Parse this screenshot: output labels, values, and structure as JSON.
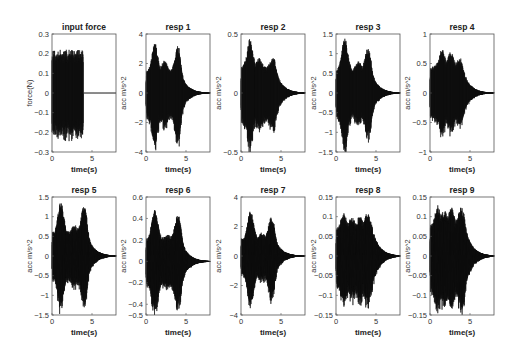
{
  "figure": {
    "layout": {
      "rows": 2,
      "cols": 5
    }
  },
  "chart_data": [
    {
      "type": "line",
      "title": "input force",
      "xlabel": "time(s)",
      "ylabel": "force(N)",
      "xlim": [
        0,
        8
      ],
      "ylim": [
        -0.3,
        0.3
      ],
      "xticks": [
        "0",
        "5"
      ],
      "yticks": [
        "0.3",
        "0.2",
        "0.1",
        "0",
        "-0.1",
        "-0.2",
        "-0.3"
      ],
      "ytick_values": [
        0.3,
        0.2,
        0.1,
        0,
        -0.1,
        -0.2,
        -0.3
      ],
      "signal": {
        "kind": "forcing",
        "amplitude": 0.2,
        "peak": 0.22,
        "end_time": 3.9
      },
      "grid": false
    },
    {
      "type": "line",
      "title": "resp 1",
      "xlabel": "time(s)",
      "ylabel": "acc m/s^2",
      "xlim": [
        0,
        8
      ],
      "ylim": [
        -4,
        4
      ],
      "xticks": [
        "0",
        "5"
      ],
      "yticks": [
        "4",
        "2",
        "0",
        "-2",
        "-4"
      ],
      "ytick_values": [
        4,
        2,
        0,
        -2,
        -4
      ],
      "signal": {
        "kind": "response",
        "peaks": [
          [
            1.1,
            3.4
          ],
          [
            2.3,
            2.2
          ],
          [
            4.0,
            3.2
          ]
        ],
        "base": 1.5,
        "decay_start": 4.2,
        "decay_end": 8.0,
        "min": -3.6
      },
      "grid": false
    },
    {
      "type": "line",
      "title": "resp 2",
      "xlabel": "time(s)",
      "ylabel": "acc m/s^2",
      "xlim": [
        0,
        8
      ],
      "ylim": [
        -0.5,
        0.5
      ],
      "xticks": [
        "0",
        "5"
      ],
      "yticks": [
        "0.5",
        "0",
        "-0.5"
      ],
      "ytick_values": [
        0.5,
        0,
        -0.5
      ],
      "signal": {
        "kind": "response",
        "peaks": [
          [
            1.1,
            0.46
          ],
          [
            2.3,
            0.3
          ],
          [
            4.0,
            0.3
          ]
        ],
        "base": 0.22,
        "decay_start": 4.2,
        "decay_end": 8.0,
        "min": -0.48
      },
      "grid": false
    },
    {
      "type": "line",
      "title": "resp 3",
      "xlabel": "time(s)",
      "ylabel": "acc m/s^2",
      "xlim": [
        0,
        8
      ],
      "ylim": [
        -1.5,
        1.5
      ],
      "xticks": [
        "0",
        "5"
      ],
      "yticks": [
        "1.5",
        "1",
        "0.5",
        "0",
        "-0.5",
        "-1",
        "-1.5"
      ],
      "ytick_values": [
        1.5,
        1,
        0.5,
        0,
        -0.5,
        -1,
        -1.5
      ],
      "signal": {
        "kind": "response",
        "peaks": [
          [
            1.1,
            1.4
          ],
          [
            2.8,
            0.8
          ],
          [
            4.0,
            1.15
          ]
        ],
        "base": 0.6,
        "decay_start": 4.3,
        "decay_end": 8.0,
        "min": -1.4
      },
      "grid": false
    },
    {
      "type": "line",
      "title": "resp 4",
      "xlabel": "time(s)",
      "ylabel": "acc m/s^2",
      "xlim": [
        0,
        8
      ],
      "ylim": [
        -1,
        1
      ],
      "xticks": [
        "0",
        "5"
      ],
      "yticks": [
        "1",
        "0.5",
        "0",
        "-0.5",
        "-1"
      ],
      "ytick_values": [
        1,
        0.5,
        0,
        -0.5,
        -1
      ],
      "signal": {
        "kind": "response",
        "peaks": [
          [
            1.5,
            0.75
          ],
          [
            2.6,
            0.7
          ],
          [
            3.7,
            0.6
          ]
        ],
        "base": 0.45,
        "decay_start": 4.0,
        "decay_end": 8.0,
        "min": -0.72
      },
      "grid": false
    },
    {
      "type": "line",
      "title": "resp 5",
      "xlabel": "time(s)",
      "ylabel": "acc m/s^2",
      "xlim": [
        0,
        8
      ],
      "ylim": [
        -1.5,
        1.5
      ],
      "xticks": [
        "0",
        "5"
      ],
      "yticks": [
        "1.5",
        "1",
        "0.5",
        "0",
        "-0.5",
        "-1",
        "-1.5"
      ],
      "ytick_values": [
        1.5,
        1,
        0.5,
        0,
        -0.5,
        -1,
        -1.5
      ],
      "signal": {
        "kind": "response",
        "peaks": [
          [
            1.1,
            1.4
          ],
          [
            2.8,
            0.8
          ],
          [
            4.0,
            1.3
          ]
        ],
        "base": 0.6,
        "decay_start": 4.3,
        "decay_end": 8.0,
        "min": -1.4
      },
      "grid": false
    },
    {
      "type": "line",
      "title": "resp 6",
      "xlabel": "time(s)",
      "ylabel": "acc m/s^2",
      "xlim": [
        0,
        8
      ],
      "ylim": [
        -0.5,
        0.6
      ],
      "xticks": [
        "0",
        "5"
      ],
      "yticks": [
        "0.6",
        "0.4",
        "0.2",
        "0",
        "-0.2",
        "-0.4",
        "-0.5"
      ],
      "ytick_values": [
        0.6,
        0.4,
        0.2,
        0,
        -0.2,
        -0.4,
        -0.5
      ],
      "signal": {
        "kind": "response",
        "peaks": [
          [
            1.1,
            0.48
          ],
          [
            2.8,
            0.25
          ],
          [
            4.0,
            0.45
          ]
        ],
        "base": 0.22,
        "decay_start": 4.3,
        "decay_end": 8.0,
        "min": -0.48
      },
      "grid": false
    },
    {
      "type": "line",
      "title": "resp 7",
      "xlabel": "time(s)",
      "ylabel": "acc m/s^2",
      "xlim": [
        0,
        8
      ],
      "ylim": [
        -4,
        4
      ],
      "xticks": [
        "0",
        "5"
      ],
      "yticks": [
        "4",
        "2",
        "0",
        "-2",
        "-4"
      ],
      "ytick_values": [
        4,
        2,
        0,
        -2,
        -4
      ],
      "signal": {
        "kind": "response",
        "peaks": [
          [
            1.2,
            3.1
          ],
          [
            2.6,
            1.6
          ],
          [
            3.8,
            2.7
          ]
        ],
        "base": 1.2,
        "decay_start": 4.2,
        "decay_end": 8.0,
        "min": -3.4
      },
      "grid": false
    },
    {
      "type": "line",
      "title": "resp 8",
      "xlabel": "time(s)",
      "ylabel": "acc m/s^2",
      "xlim": [
        0,
        8
      ],
      "ylim": [
        -0.15,
        0.15
      ],
      "xticks": [
        "0",
        "5"
      ],
      "yticks": [
        "0.15",
        "0.1",
        "0.05",
        "0",
        "-0.05",
        "-0.1",
        "-0.15"
      ],
      "ytick_values": [
        0.15,
        0.1,
        0.05,
        0,
        -0.05,
        -0.1,
        -0.15
      ],
      "signal": {
        "kind": "response",
        "peaks": [
          [
            1.0,
            0.11
          ],
          [
            2.0,
            0.1
          ],
          [
            3.0,
            0.105
          ],
          [
            3.9,
            0.11
          ]
        ],
        "base": 0.07,
        "decay_start": 4.5,
        "decay_end": 8.0,
        "min": -0.13
      },
      "grid": false
    },
    {
      "type": "line",
      "title": "resp 9",
      "xlabel": "time(s)",
      "ylabel": "acc m/s^2",
      "xlim": [
        0,
        8
      ],
      "ylim": [
        -0.15,
        0.15
      ],
      "xticks": [
        "0",
        "5"
      ],
      "yticks": [
        "0.15",
        "0.1",
        "0.05",
        "0",
        "-0.05",
        "-0.1",
        "-0.15"
      ],
      "ytick_values": [
        0.15,
        0.1,
        0.05,
        0,
        -0.05,
        -0.1,
        -0.15
      ],
      "signal": {
        "kind": "response",
        "peaks": [
          [
            1.0,
            0.13
          ],
          [
            1.8,
            0.12
          ],
          [
            2.7,
            0.125
          ],
          [
            3.9,
            0.125
          ]
        ],
        "base": 0.08,
        "decay_start": 4.3,
        "decay_end": 8.0,
        "min": -0.145
      },
      "grid": false
    }
  ]
}
